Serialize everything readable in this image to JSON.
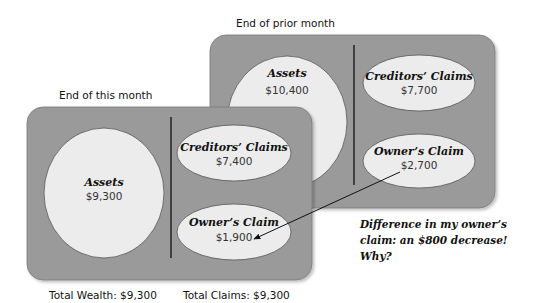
{
  "prior_month": {
    "title": "End of prior month",
    "assets": {
      "label": "Assets",
      "value": "$10,400"
    },
    "creditors_claims": {
      "label": "Creditors’ Claims",
      "value": "$7,700"
    },
    "owners_claim": {
      "label": "Owner’s Claim",
      "value": "$2,700"
    }
  },
  "this_month": {
    "title": "End of this month",
    "assets": {
      "label": "Assets",
      "value": "$9,300"
    },
    "creditors_claims": {
      "label": "Creditors’ Claims",
      "value": "$7,400"
    },
    "owners_claim": {
      "label": "Owner’s Claim",
      "value": "$1,900"
    }
  },
  "totals": {
    "wealth": "Total Wealth: $9,300",
    "claims": "Total Claims: $9,300"
  },
  "annotation": {
    "line1": "Difference in my owner’s",
    "line2": "claim: an $800 decrease!",
    "line3": "Why?"
  },
  "colors": {
    "box_fill": "#9a9a9a",
    "shape_fill": "#ececec",
    "shape_stroke": "#555555",
    "divider": "#222222"
  }
}
